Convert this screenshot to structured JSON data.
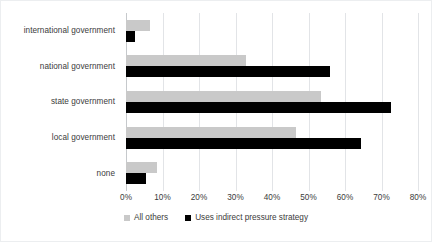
{
  "chart_data": {
    "type": "bar",
    "orientation": "horizontal",
    "title": "",
    "subtitle": "",
    "xlabel": "",
    "ylabel": "",
    "categories": [
      "international government",
      "national government",
      "state government",
      "local government",
      "none"
    ],
    "series": [
      {
        "name": "All others",
        "color": "#c9c9c9",
        "values": [
          6.5,
          33,
          53.5,
          46.5,
          8.5
        ]
      },
      {
        "name": "Uses indirect pressure strategy",
        "color": "#000000",
        "values": [
          2.5,
          56,
          72.5,
          64.5,
          5.5
        ]
      }
    ],
    "xlim": [
      0,
      80
    ],
    "xtick_values": [
      0,
      10,
      20,
      30,
      40,
      50,
      60,
      70,
      80
    ],
    "xtick_labels": [
      "0%",
      "10%",
      "20%",
      "30%",
      "40%",
      "50%",
      "60%",
      "70%",
      "80%"
    ],
    "grid": "vertical",
    "legend_position": "bottom"
  },
  "legend": {
    "items": [
      {
        "label": "All others",
        "swatch": "gray"
      },
      {
        "label": "Uses indirect pressure strategy",
        "swatch": "black"
      }
    ]
  }
}
